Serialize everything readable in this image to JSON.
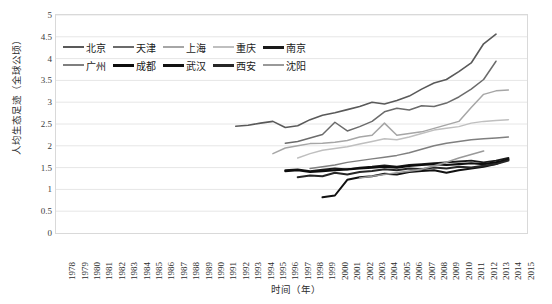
{
  "chart_data": {
    "type": "line",
    "title": "",
    "xlabel": "时间（年）",
    "ylabel": "人均生态足迹（全球公顷）",
    "xlim": [
      1978,
      2015
    ],
    "ylim": [
      0,
      5
    ],
    "ytick_step": 0.5,
    "grid": true,
    "legend_position": "top-left",
    "x": [
      1978,
      1979,
      1980,
      1981,
      1982,
      1983,
      1984,
      1985,
      1986,
      1987,
      1988,
      1989,
      1990,
      1991,
      1992,
      1993,
      1994,
      1995,
      1996,
      1997,
      1998,
      1999,
      2000,
      2001,
      2002,
      2003,
      2004,
      2005,
      2006,
      2007,
      2008,
      2009,
      2010,
      2011,
      2012,
      2013,
      2014,
      2015
    ],
    "y_ticks": [
      "0",
      "0.5",
      "1",
      "1.5",
      "2",
      "2.5",
      "3",
      "3.5",
      "4",
      "4.5",
      "5"
    ],
    "x_ticks": [
      "1978",
      "1979",
      "1980",
      "1981",
      "1982",
      "1983",
      "1984",
      "1985",
      "1986",
      "1987",
      "1988",
      "1989",
      "1990",
      "1991",
      "1992",
      "1993",
      "1994",
      "1995",
      "1996",
      "1997",
      "1998",
      "1999",
      "2000",
      "2001",
      "2002",
      "2003",
      "2004",
      "2005",
      "2006",
      "2007",
      "2008",
      "2009",
      "2010",
      "2011",
      "2012",
      "2013",
      "2014",
      "2015"
    ],
    "series": [
      {
        "name": "北京",
        "color": "#595959",
        "width": 1.6,
        "x": [
          1992,
          1993,
          1994,
          1995,
          1996,
          1997,
          1998,
          1999,
          2000,
          2001,
          2002,
          2003,
          2004,
          2005,
          2006,
          2007,
          2008,
          2009,
          2010,
          2011,
          2012,
          2013
        ],
        "values": [
          2.45,
          2.47,
          2.52,
          2.56,
          2.42,
          2.46,
          2.6,
          2.7,
          2.76,
          2.83,
          2.9,
          3.0,
          2.96,
          3.04,
          3.14,
          3.3,
          3.44,
          3.52,
          3.7,
          3.9,
          4.34,
          4.56
        ]
      },
      {
        "name": "天津",
        "color": "#6b6b6b",
        "width": 1.5,
        "x": [
          1996,
          1997,
          1998,
          1999,
          2000,
          2001,
          2002,
          2003,
          2004,
          2005,
          2006,
          2007,
          2008,
          2009,
          2010,
          2011,
          2012,
          2013
        ],
        "values": [
          2.06,
          2.1,
          2.18,
          2.26,
          2.54,
          2.34,
          2.44,
          2.56,
          2.78,
          2.86,
          2.82,
          2.92,
          2.9,
          2.98,
          3.12,
          3.3,
          3.52,
          3.94
        ]
      },
      {
        "name": "上海",
        "color": "#a6a6a6",
        "width": 1.5,
        "x": [
          1995,
          1996,
          1997,
          1998,
          1999,
          2000,
          2001,
          2002,
          2003,
          2004,
          2005,
          2006,
          2007,
          2008,
          2009,
          2010,
          2011,
          2012,
          2013,
          2014
        ],
        "values": [
          1.82,
          1.95,
          2.0,
          2.05,
          2.06,
          2.08,
          2.12,
          2.2,
          2.24,
          2.52,
          2.24,
          2.28,
          2.32,
          2.4,
          2.48,
          2.56,
          2.88,
          3.18,
          3.26,
          3.28
        ]
      },
      {
        "name": "重庆",
        "color": "#bfbfbf",
        "width": 1.5,
        "x": [
          1997,
          1998,
          1999,
          2000,
          2001,
          2002,
          2003,
          2004,
          2005,
          2006,
          2007,
          2008,
          2009,
          2010,
          2011,
          2012,
          2013,
          2014
        ],
        "values": [
          1.72,
          1.82,
          1.9,
          1.94,
          1.98,
          2.04,
          2.1,
          2.16,
          2.14,
          2.2,
          2.28,
          2.36,
          2.4,
          2.44,
          2.52,
          2.56,
          2.58,
          2.6
        ]
      },
      {
        "name": "南京",
        "color": "#1a1a1a",
        "width": 1.9,
        "x": [
          1996,
          1997,
          1998,
          1999,
          2000,
          2001,
          2002,
          2003,
          2004,
          2005,
          2006,
          2007,
          2008,
          2009,
          2010,
          2011,
          2012,
          2013,
          2014
        ],
        "values": [
          1.44,
          1.46,
          1.42,
          1.45,
          1.48,
          1.46,
          1.5,
          1.52,
          1.55,
          1.52,
          1.56,
          1.58,
          1.6,
          1.62,
          1.64,
          1.66,
          1.62,
          1.66,
          1.72
        ]
      },
      {
        "name": "广州",
        "color": "#7f7f7f",
        "width": 1.5,
        "x": [
          1998,
          1999,
          2000,
          2001,
          2002,
          2003,
          2004,
          2005,
          2006,
          2007,
          2008,
          2009,
          2010,
          2011,
          2012,
          2013,
          2014
        ],
        "values": [
          1.48,
          1.52,
          1.56,
          1.62,
          1.66,
          1.7,
          1.74,
          1.78,
          1.84,
          1.92,
          2.0,
          2.06,
          2.1,
          2.14,
          2.16,
          2.18,
          2.2
        ]
      },
      {
        "name": "成都",
        "color": "#0d0d0d",
        "width": 2.1,
        "x": [
          1996,
          1997,
          1998,
          1999,
          2000,
          2001,
          2002,
          2003,
          2004,
          2005,
          2006,
          2007,
          2008,
          2009,
          2010,
          2011,
          2012,
          2013,
          2014
        ],
        "values": [
          1.42,
          1.44,
          1.4,
          1.42,
          1.44,
          1.46,
          1.48,
          1.5,
          1.52,
          1.5,
          1.54,
          1.56,
          1.58,
          1.56,
          1.58,
          1.6,
          1.58,
          1.62,
          1.68
        ]
      },
      {
        "name": "武汉",
        "color": "#111111",
        "width": 2.0,
        "x": [
          1999,
          2000,
          2001,
          2002,
          2003,
          2004,
          2005,
          2006,
          2007,
          2008,
          2009,
          2010,
          2011,
          2012,
          2013,
          2014
        ],
        "values": [
          0.82,
          0.86,
          1.22,
          1.28,
          1.3,
          1.36,
          1.34,
          1.4,
          1.42,
          1.44,
          1.38,
          1.44,
          1.48,
          1.52,
          1.58,
          1.7
        ]
      },
      {
        "name": "西安",
        "color": "#262626",
        "width": 2.0,
        "x": [
          1997,
          1998,
          1999,
          2000,
          2001,
          2002,
          2003,
          2004,
          2005,
          2006,
          2007,
          2008,
          2009,
          2010,
          2011,
          2012,
          2013,
          2014
        ],
        "values": [
          1.28,
          1.32,
          1.3,
          1.38,
          1.34,
          1.4,
          1.42,
          1.46,
          1.44,
          1.48,
          1.46,
          1.5,
          1.48,
          1.52,
          1.5,
          1.54,
          1.58,
          1.66
        ]
      },
      {
        "name": "沈阳",
        "color": "#999999",
        "width": 1.6,
        "x": [
          2002,
          2003,
          2004,
          2005,
          2006,
          2007,
          2008,
          2009,
          2010,
          2011,
          2012
        ],
        "values": [
          1.26,
          1.3,
          1.34,
          1.38,
          1.42,
          1.46,
          1.54,
          1.62,
          1.72,
          1.8,
          1.88
        ]
      }
    ]
  },
  "legend": {
    "rows": [
      [
        {
          "label": "北京",
          "color": "#595959",
          "width": 2
        },
        {
          "label": "天津",
          "color": "#6b6b6b",
          "width": 2
        },
        {
          "label": "上海",
          "color": "#a6a6a6",
          "width": 2
        },
        {
          "label": "重庆",
          "color": "#bfbfbf",
          "width": 2
        },
        {
          "label": "南京",
          "color": "#1a1a1a",
          "width": 3
        }
      ],
      [
        {
          "label": "广州",
          "color": "#7f7f7f",
          "width": 2
        },
        {
          "label": "成都",
          "color": "#0d0d0d",
          "width": 3
        },
        {
          "label": "武汉",
          "color": "#111111",
          "width": 3
        },
        {
          "label": "西安",
          "color": "#262626",
          "width": 3
        },
        {
          "label": "沈阳",
          "color": "#999999",
          "width": 2
        }
      ]
    ]
  },
  "axes": {
    "y_title": "人均生态足迹（全球公顷）",
    "x_title": "时间（年）"
  },
  "colors": {
    "grid": "#e6e6e6",
    "frame": "#d9d9d9",
    "text": "#2b2b2b",
    "background": "#ffffff"
  }
}
